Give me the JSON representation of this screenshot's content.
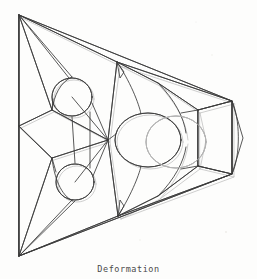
{
  "figure": {
    "caption": "Deformation",
    "background_color": "#fdfdfc",
    "line_color": "#3a3a3a",
    "faint_line_color": "#b9b9b9",
    "caption_color": "#4a4a4a",
    "width": 257,
    "height": 279
  },
  "chart_data": {
    "type": "line",
    "title": "Deformation",
    "xlabel": "",
    "ylabel": "",
    "grid": false,
    "legend": null,
    "xlim": [
      0,
      257
    ],
    "ylim": [
      0,
      279
    ],
    "nodes": {
      "apex_top_left": [
        19,
        15
      ],
      "apex_bottom_left": [
        19,
        256
      ],
      "mid_left": [
        19,
        126
      ],
      "left_upper_inner": [
        52,
        110
      ],
      "left_lower_inner": [
        52,
        158
      ],
      "top_hub": [
        117,
        62
      ],
      "bottom_hub": [
        118,
        216
      ],
      "center_hub": [
        108,
        140
      ],
      "upper_right_node": [
        232,
        101
      ],
      "lower_right_node": [
        232,
        174
      ],
      "upper_right_inner": [
        198,
        110
      ],
      "lower_right_inner": [
        198,
        166
      ],
      "upper_mid_node": [
        158,
        83
      ],
      "lower_mid_node": [
        158,
        196
      ]
    },
    "holes": [
      {
        "name": "top-left-hole",
        "cx": 72,
        "cy": 97,
        "rx": 20,
        "ry": 19,
        "rotation": 0
      },
      {
        "name": "bottom-left-hole",
        "cx": 75,
        "cy": 182,
        "rx": 19,
        "ry": 18,
        "rotation": 0
      },
      {
        "name": "center-hole",
        "cx": 148,
        "cy": 140,
        "rx": 33,
        "ry": 27,
        "rotation": 0
      },
      {
        "name": "center-hole-ghost",
        "cx": 176,
        "cy": 142,
        "rx": 30,
        "ry": 26,
        "rotation": 0
      }
    ],
    "series": [
      {
        "name": "outer-silhouette",
        "values": [
          [
            19,
            15
          ],
          [
            232,
            101
          ],
          [
            232,
            174
          ],
          [
            19,
            256
          ],
          [
            19,
            15
          ]
        ]
      },
      {
        "name": "right-bulge-edge",
        "values": [
          [
            232,
            101
          ],
          [
            243,
            138
          ],
          [
            232,
            174
          ]
        ]
      },
      {
        "name": "left-vertical-edge",
        "values": [
          [
            19,
            15
          ],
          [
            19,
            126
          ],
          [
            19,
            256
          ]
        ]
      },
      {
        "name": "top-fan",
        "values": [
          [
            19,
            15
          ],
          [
            117,
            62
          ],
          [
            19,
            15
          ],
          [
            72,
            77
          ],
          [
            19,
            15
          ],
          [
            52,
            110
          ]
        ]
      },
      {
        "name": "bottom-fan",
        "values": [
          [
            19,
            256
          ],
          [
            118,
            216
          ],
          [
            19,
            256
          ],
          [
            75,
            201
          ],
          [
            19,
            256
          ],
          [
            52,
            158
          ]
        ]
      },
      {
        "name": "upper-chord",
        "values": [
          [
            117,
            62
          ],
          [
            232,
            101
          ]
        ]
      },
      {
        "name": "lower-chord",
        "values": [
          [
            118,
            216
          ],
          [
            232,
            174
          ]
        ]
      },
      {
        "name": "left-quad",
        "values": [
          [
            19,
            126
          ],
          [
            52,
            110
          ],
          [
            108,
            140
          ],
          [
            52,
            158
          ],
          [
            19,
            126
          ]
        ]
      },
      {
        "name": "inner-right-quad",
        "values": [
          [
            198,
            110
          ],
          [
            232,
            101
          ],
          [
            232,
            174
          ],
          [
            198,
            166
          ],
          [
            198,
            110
          ]
        ]
      },
      {
        "name": "hub-spokes",
        "values": [
          [
            108,
            140
          ],
          [
            117,
            62
          ],
          [
            108,
            140
          ],
          [
            118,
            216
          ],
          [
            108,
            140
          ],
          [
            72,
            97
          ],
          [
            108,
            140
          ],
          [
            75,
            182
          ]
        ]
      },
      {
        "name": "center-spokes",
        "values": [
          [
            117,
            62
          ],
          [
            158,
            83
          ],
          [
            158,
            83
          ],
          [
            198,
            110
          ],
          [
            118,
            216
          ],
          [
            158,
            196
          ],
          [
            158,
            196
          ],
          [
            198,
            166
          ]
        ]
      }
    ]
  }
}
